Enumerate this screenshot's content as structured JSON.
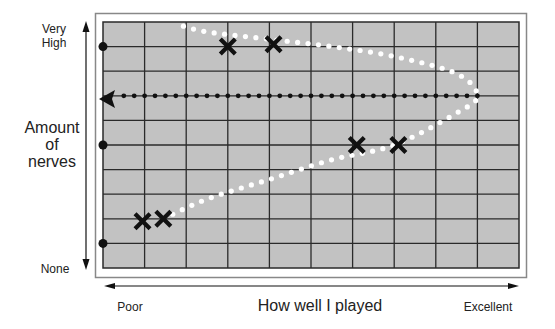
{
  "y_axis": {
    "top_label_line1": "Very",
    "top_label_line2": "High",
    "title_line1": "Amount",
    "title_line2": "of",
    "title_line3": "nerves",
    "bottom_label": "None"
  },
  "x_axis": {
    "left_label": "Poor",
    "title": "How well I played",
    "right_label": "Excellent"
  },
  "colors": {
    "grid_fill": "#c2c2c2",
    "grid_line": "#2a2a2a",
    "frame": "#888888",
    "marker": "#111111",
    "curve_dots": "#ffffff"
  },
  "chart_data": {
    "type": "scatter",
    "title": "",
    "xlabel": "How well I played",
    "ylabel": "Amount of nerves",
    "x_range_labels": [
      "Poor",
      "Excellent"
    ],
    "y_range_labels": [
      "None",
      "Very High"
    ],
    "grid": {
      "columns": 10,
      "rows": 10
    },
    "xlim": [
      0,
      10
    ],
    "ylim": [
      0,
      10
    ],
    "points": [
      {
        "x": 0.95,
        "y": 1.9
      },
      {
        "x": 1.45,
        "y": 2.0
      },
      {
        "x": 3.0,
        "y": 9.0
      },
      {
        "x": 4.1,
        "y": 9.1
      },
      {
        "x": 6.1,
        "y": 5.0
      },
      {
        "x": 7.1,
        "y": 5.0
      }
    ],
    "edge_points_y": [
      9.0,
      5.0,
      1.0
    ],
    "curve": {
      "style": "white-dotted",
      "description": "Inverted-U curve: performance peaks at moderate nerves",
      "x": [
        1.45,
        2.5,
        4.0,
        5.5,
        7.0,
        8.5,
        9.0,
        8.5,
        7.0,
        5.5,
        4.0,
        2.5,
        1.8
      ],
      "y": [
        2.0,
        2.8,
        3.6,
        4.4,
        5.0,
        6.3,
        7.0,
        7.9,
        8.6,
        9.0,
        9.3,
        9.6,
        9.9
      ]
    },
    "optimal_line": {
      "style": "black-dotted-arrow",
      "y": 7.0,
      "from_x": 9.0,
      "to_x": 0.0
    }
  }
}
